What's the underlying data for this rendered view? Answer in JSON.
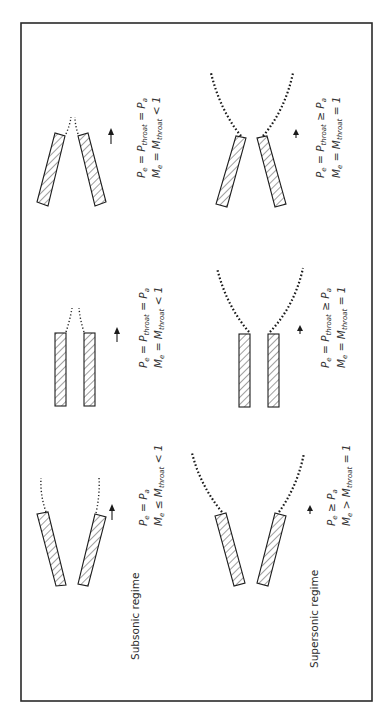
{
  "figure": {
    "orientation": "rotated 90deg counter-clockwise",
    "rows": [
      {
        "label": "Subsonic regime",
        "panels": [
          {
            "nozzle": "converging-diverging (flared walls)",
            "eq1": {
              "lhs": "P",
              "lhs_sub": "e",
              "mid": "= P",
              "mid_sub": "a",
              "rest": ""
            },
            "eq1_text": "P_e = P_a",
            "eq2_text": "M_e ≤ M_throat < 1",
            "eq1_parts": [
              "P",
              "e",
              " = P",
              "a"
            ],
            "eq2_parts": [
              "M",
              "e",
              " ≤ M",
              "throat",
              " < 1"
            ]
          },
          {
            "nozzle": "straight (parallel walls)",
            "eq1_text": "P_e = P_throat = P_a",
            "eq2_text": "M_e = M_throat < 1",
            "eq1_parts": [
              "P",
              "e",
              " = P",
              "throat",
              " = P",
              "a"
            ],
            "eq2_parts": [
              "M",
              "e",
              " = M",
              "throat",
              " < 1"
            ]
          },
          {
            "nozzle": "converging",
            "eq1_text": "P_e = P_throat = P_a",
            "eq2_text": "M_e = M_throat < 1",
            "eq1_parts": [
              "P",
              "e",
              " = P",
              "throat",
              " = P",
              "a"
            ],
            "eq2_parts": [
              "M",
              "e",
              " = M",
              "throat",
              " < 1"
            ]
          }
        ]
      },
      {
        "label": "Supersonic regime",
        "panels": [
          {
            "nozzle": "converging-diverging (flared walls)",
            "eq1_text": "P_e ≥ P_a",
            "eq2_text": "M_e > M_throat = 1",
            "eq1_parts": [
              "P",
              "e",
              " ≥ P",
              "a"
            ],
            "eq2_parts": [
              "M",
              "e",
              " > M",
              "throat",
              " = 1"
            ]
          },
          {
            "nozzle": "straight (parallel walls)",
            "eq1_text": "P_e = P_throat ≥ P_a",
            "eq2_text": "M_e = M_throat = 1",
            "eq1_parts": [
              "P",
              "e",
              " = P",
              "throat",
              " ≥ P",
              "a"
            ],
            "eq2_parts": [
              "M",
              "e",
              " = M",
              "throat",
              " = 1"
            ]
          },
          {
            "nozzle": "converging",
            "eq1_text": "P_e = P_throat ≥ P_a",
            "eq2_text": "M_e = M_throat = 1",
            "eq1_parts": [
              "P",
              "e",
              " = P",
              "throat",
              " ≥ P",
              "a"
            ],
            "eq2_parts": [
              "M",
              "e",
              " = M",
              "throat",
              " = 1"
            ]
          }
        ]
      }
    ],
    "colors": {
      "stroke": "#1e1e1e",
      "text": "#333333",
      "background": "#ffffff"
    }
  }
}
